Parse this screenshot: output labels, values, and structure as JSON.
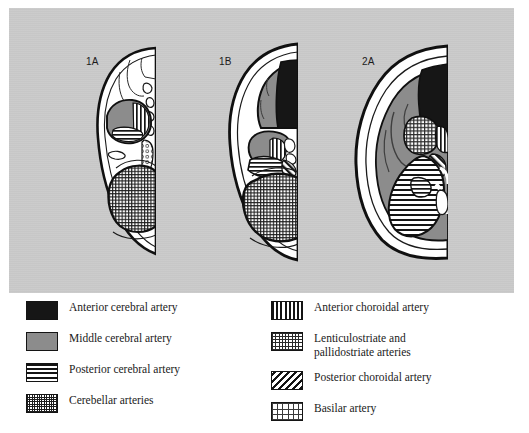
{
  "figure": {
    "background_color": "#c9c9c9",
    "legend_background_color": "#ffffff"
  },
  "sections": [
    {
      "id": "1A",
      "label": "1A"
    },
    {
      "id": "1B",
      "label": "1B"
    },
    {
      "id": "2A",
      "label": "2A"
    }
  ],
  "legend": {
    "left_column": [
      {
        "label": "Anterior cerebral artery",
        "pattern": "solid-black",
        "color": "#161616"
      },
      {
        "label": "Middle cerebral artery",
        "pattern": "solid-gray",
        "color": "#8c8c8c"
      },
      {
        "label": "Posterior cerebral artery",
        "pattern": "horizontal-stripes",
        "color": "#141414"
      },
      {
        "label": "Cerebellar arteries",
        "pattern": "fine-mesh",
        "color": "#1d1d1d"
      }
    ],
    "right_column": [
      {
        "label": "Anterior choroidal artery",
        "label_line2": "",
        "pattern": "vertical-stripes",
        "color": "#141414"
      },
      {
        "label": "Lenticulostriate and",
        "label_line2": "pallidostriate arteries",
        "pattern": "checkered",
        "color": "#2a2a2a"
      },
      {
        "label": "Posterior choroidal artery",
        "label_line2": "",
        "pattern": "diagonal-hatch",
        "color": "#141414"
      },
      {
        "label": "Basilar artery",
        "label_line2": "",
        "pattern": "open-dots",
        "color": "#3a3a3a"
      }
    ]
  }
}
